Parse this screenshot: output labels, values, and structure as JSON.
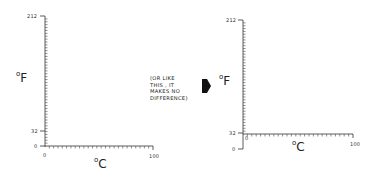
{
  "left_chart": {
    "y_unit": "F",
    "x_unit": "C",
    "y_ticks": {
      "top": "212",
      "mid": "32",
      "zero": "0"
    },
    "x_ticks": {
      "zero": "0",
      "end": "100"
    }
  },
  "note": {
    "lines": [
      "(OR LIKE",
      "THIS , IT",
      "MAKES NO",
      "DIFFERENCE)"
    ]
  },
  "arrow": {
    "icon": "arrow-right-icon",
    "color": "#111111"
  },
  "right_chart": {
    "y_unit": "F",
    "x_unit": "C",
    "y_ticks": {
      "top": "212",
      "mid": "32",
      "zero": "0"
    },
    "x_ticks": {
      "zero": "0",
      "end": "100"
    }
  }
}
